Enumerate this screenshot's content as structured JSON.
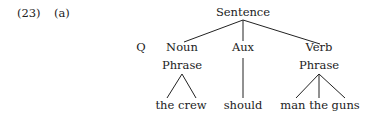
{
  "example": {
    "number": "(23)",
    "sub_label": "(a)"
  },
  "tree": {
    "root": {
      "label": "Sentence"
    },
    "prefix": {
      "label": "Q"
    },
    "children": [
      {
        "label_line1": "Noun",
        "label_line2": "Phrase",
        "leaf": "the crew",
        "attachment": "triangle"
      },
      {
        "label_line1": "Aux",
        "leaf": "should",
        "attachment": "line"
      },
      {
        "label_line1": "Verb",
        "label_line2": "Phrase",
        "leaf": "man the guns",
        "attachment": "three-prong"
      }
    ]
  },
  "colors": {
    "text": "#222222",
    "lines": "#222222",
    "background": "#ffffff"
  }
}
